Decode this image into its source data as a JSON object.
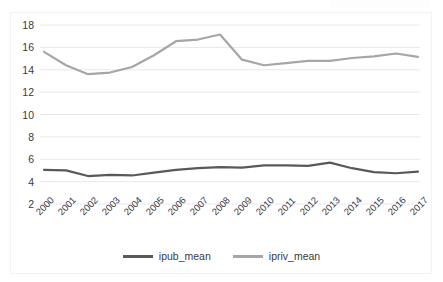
{
  "chart_data": {
    "type": "line",
    "title": "",
    "subtitle": "",
    "xlabel": "",
    "ylabel": "",
    "categories": [
      "2000",
      "2001",
      "2002",
      "2003",
      "2004",
      "2005",
      "2006",
      "2007",
      "2008",
      "2009",
      "2010",
      "2011",
      "2012",
      "2013",
      "2014",
      "2015",
      "2016",
      "2017"
    ],
    "series": [
      {
        "name": "ipub_mean",
        "color": "#595959",
        "values": [
          5.05,
          5.0,
          4.5,
          4.6,
          4.55,
          4.8,
          5.05,
          5.2,
          5.3,
          5.25,
          5.45,
          5.45,
          5.4,
          5.7,
          5.2,
          4.85,
          4.75,
          4.9
        ]
      },
      {
        "name": "ipriv_mean",
        "color": "#a6a6a6",
        "values": [
          15.6,
          14.4,
          13.6,
          13.75,
          14.25,
          15.3,
          16.55,
          16.7,
          17.15,
          14.9,
          14.4,
          14.6,
          14.8,
          14.8,
          15.05,
          15.2,
          15.45,
          15.15
        ]
      }
    ],
    "ylim": [
      2,
      18
    ],
    "yticks": [
      2,
      4,
      6,
      8,
      10,
      12,
      14,
      16,
      18
    ],
    "ytick_labels": [
      "2",
      "4",
      "6",
      "8",
      "10",
      "12",
      "14",
      "16",
      "18"
    ],
    "grid": true,
    "grid_axis": "y",
    "grid_color": "#e8e8e8",
    "legend_position": "bottom",
    "xtick_rotation": -45,
    "background": "#ffffff"
  },
  "legend": {
    "items": [
      {
        "label": "ipub_mean",
        "color": "#595959"
      },
      {
        "label": "ipriv_mean",
        "color": "#a6a6a6"
      }
    ]
  }
}
